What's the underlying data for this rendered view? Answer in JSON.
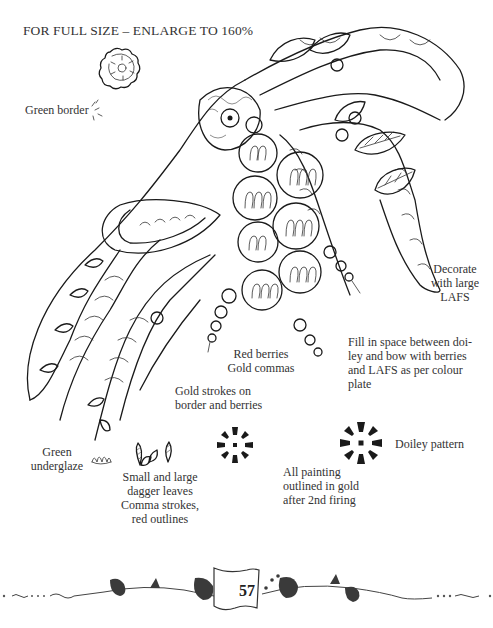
{
  "header": {
    "text": "FOR FULL SIZE – ENLARGE TO 160%"
  },
  "annotations": {
    "green_border": "Green border",
    "decorate": [
      "Decorate",
      "with large",
      "LAFS"
    ],
    "red_berries": [
      "Red berries",
      "Gold commas"
    ],
    "fill_space": [
      "Fill in space between doi-",
      "ley and bow with berries",
      "and LAFS as per colour",
      "plate"
    ],
    "gold_strokes": [
      "Gold strokes on",
      "border and berries"
    ],
    "green_underglaze": [
      "Green",
      "underglaze"
    ],
    "dagger_leaves": [
      "Small and large",
      "dagger leaves",
      "Comma strokes,",
      "red outlines"
    ],
    "doiley_pattern": "Doiley pattern",
    "all_painting": [
      "All painting",
      "outlined in gold",
      "after 2nd firing"
    ]
  },
  "footer": {
    "page_number": "57"
  },
  "colors": {
    "ink": "#1a1a1a",
    "paper": "#ffffff",
    "text": "#333333"
  }
}
